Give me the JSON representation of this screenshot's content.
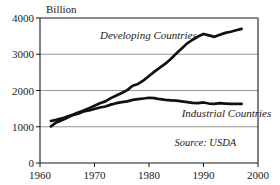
{
  "chart_data": {
    "type": "line",
    "title": "",
    "subtitle": "",
    "unit_label": "Billion",
    "xlabel": "",
    "ylabel": "",
    "xlim": [
      1960,
      2000
    ],
    "ylim": [
      0,
      4000
    ],
    "xticks": [
      "1960",
      "1970",
      "1980",
      "1990",
      "2000"
    ],
    "xtick_values": [
      1960,
      1970,
      1980,
      1990,
      2000
    ],
    "yticks": [
      "0",
      "1000",
      "2000",
      "3000",
      "4000"
    ],
    "ytick_values": [
      0,
      1000,
      2000,
      3000,
      4000
    ],
    "grid": "horizontal",
    "gridlines": [
      1000,
      2000,
      3000
    ],
    "legend_position": "inline-annotation",
    "annotations": [
      {
        "name": "source-note",
        "text": "Source: USDA",
        "x": 1996,
        "y": 480
      }
    ],
    "series": [
      {
        "name": "Developing Countries",
        "label": "Developing Countries",
        "color": "#111111",
        "label_x": 1971,
        "label_y": 3430,
        "x": [
          1962,
          1963,
          1964,
          1965,
          1966,
          1967,
          1968,
          1969,
          1970,
          1971,
          1972,
          1973,
          1974,
          1975,
          1976,
          1977,
          1978,
          1979,
          1980,
          1981,
          1982,
          1983,
          1984,
          1985,
          1986,
          1987,
          1988,
          1989,
          1990,
          1991,
          1992,
          1993,
          1994,
          1995,
          1996,
          1997
        ],
        "values": [
          1160,
          1190,
          1230,
          1280,
          1330,
          1390,
          1450,
          1510,
          1580,
          1650,
          1700,
          1790,
          1860,
          1930,
          2010,
          2130,
          2180,
          2280,
          2400,
          2520,
          2630,
          2740,
          2870,
          3020,
          3160,
          3300,
          3400,
          3490,
          3560,
          3520,
          3480,
          3540,
          3590,
          3620,
          3660,
          3700
        ]
      },
      {
        "name": "Industrial Countries",
        "label": "Industrial Countries",
        "color": "#111111",
        "label_x": 1986,
        "label_y": 1270,
        "x": [
          1962,
          1963,
          1964,
          1965,
          1966,
          1967,
          1968,
          1969,
          1970,
          1971,
          1972,
          1973,
          1974,
          1975,
          1976,
          1977,
          1978,
          1979,
          1980,
          1981,
          1982,
          1983,
          1984,
          1985,
          1986,
          1987,
          1988,
          1989,
          1990,
          1991,
          1992,
          1993,
          1994,
          1995,
          1996,
          1997
        ],
        "values": [
          1010,
          1120,
          1180,
          1250,
          1320,
          1360,
          1420,
          1450,
          1490,
          1530,
          1560,
          1610,
          1650,
          1680,
          1700,
          1740,
          1760,
          1780,
          1800,
          1790,
          1760,
          1740,
          1730,
          1720,
          1700,
          1680,
          1660,
          1650,
          1670,
          1640,
          1630,
          1650,
          1640,
          1630,
          1635,
          1630
        ]
      }
    ]
  },
  "plot": {
    "left": 40,
    "right": 258,
    "top": 18,
    "bottom": 163
  }
}
